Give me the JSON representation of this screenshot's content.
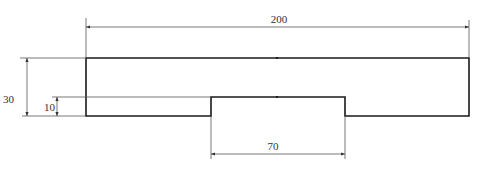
{
  "drawing": {
    "type": "stepped-plate-dimension-drawing",
    "colors": {
      "outline": "#1a1a1a",
      "dimension": "#555555",
      "text": "#333333",
      "background": "#ffffff"
    },
    "dimensions": {
      "overall_width": {
        "label": "200"
      },
      "step_width": {
        "label": "70"
      },
      "overall_height": {
        "label": "30"
      },
      "step_height": {
        "label": "10"
      }
    }
  }
}
